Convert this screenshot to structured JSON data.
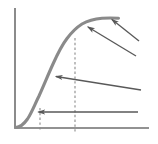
{
  "figure": {
    "kind": "annotated-sigmoid-curve-diagram",
    "width": 158,
    "height": 144,
    "background_color": "#ffffff",
    "axis_color": "#6e6e6e",
    "curve_color": "#8a8a8a",
    "annotation_color": "#595959",
    "dash_color": "#8a8a8a"
  },
  "chart_data": {
    "type": "line",
    "title": "",
    "xlabel": "",
    "ylabel": "",
    "grid": false,
    "legend": null,
    "xlim": [
      0,
      1
    ],
    "ylim": [
      0,
      1
    ],
    "series": [
      {
        "name": "sigmoid-growth-curve",
        "x": [
          0.0,
          0.05,
          0.12,
          0.2,
          0.28,
          0.35,
          0.42,
          0.5,
          0.58,
          0.66,
          0.74,
          0.82,
          0.9,
          0.96
        ],
        "values": [
          0.0,
          0.02,
          0.06,
          0.13,
          0.24,
          0.39,
          0.56,
          0.7,
          0.8,
          0.87,
          0.91,
          0.93,
          0.94,
          0.94
        ]
      }
    ],
    "markers": [
      {
        "name": "lower-threshold-dashed",
        "x": 0.19,
        "y_from": 0.0,
        "y_to": 0.14
      },
      {
        "name": "inflection-dashed",
        "x": 0.45,
        "y_from": 0.0,
        "y_to": 0.75
      }
    ],
    "annotations": [
      {
        "name": "annotation-pointer-baseline",
        "tail_x": 0.92,
        "tail_y": 0.13,
        "head_x": 0.17,
        "head_y": 0.13,
        "label": ""
      },
      {
        "name": "annotation-pointer-midrise",
        "tail_x": 0.95,
        "tail_y": 0.29,
        "head_x": 0.31,
        "head_y": 0.41,
        "label": ""
      },
      {
        "name": "annotation-pointer-upper-shoulder",
        "tail_x": 0.91,
        "tail_y": 0.67,
        "head_x": 0.55,
        "head_y": 0.79,
        "label": ""
      },
      {
        "name": "annotation-pointer-plateau",
        "tail_x": 0.94,
        "tail_y": 0.79,
        "head_x": 0.72,
        "head_y": 0.86,
        "label": ""
      }
    ]
  },
  "axes": {
    "y_axis": {
      "name": "vertical-axis",
      "x": 15,
      "y_top": 8,
      "y_bottom": 128
    },
    "x_axis": {
      "name": "horizontal-axis",
      "y": 128,
      "x_left": 15,
      "x_right": 149
    }
  }
}
